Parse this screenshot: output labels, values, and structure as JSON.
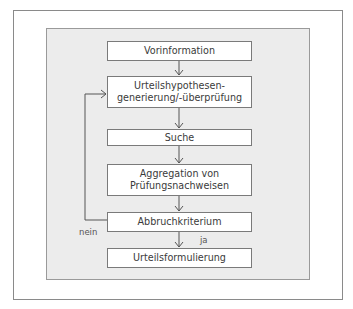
{
  "diagram": {
    "type": "flowchart",
    "nodes": [
      {
        "id": "vorinformation",
        "label": "Vorinformation"
      },
      {
        "id": "hypothesen",
        "label_line1": "Urteilshypothesen-",
        "label_line2": "generierung/-überprüfung"
      },
      {
        "id": "suche",
        "label": "Suche"
      },
      {
        "id": "aggregation",
        "label_line1": "Aggregation von",
        "label_line2": "Prüfungsnachweisen"
      },
      {
        "id": "abbruch",
        "label": "Abbruchkriterium"
      },
      {
        "id": "urteil",
        "label": "Urteilsformulierung"
      }
    ],
    "edges": [
      {
        "from": "vorinformation",
        "to": "hypothesen"
      },
      {
        "from": "hypothesen",
        "to": "suche"
      },
      {
        "from": "suche",
        "to": "aggregation"
      },
      {
        "from": "aggregation",
        "to": "abbruch"
      },
      {
        "from": "abbruch",
        "to": "urteil",
        "label": "ja"
      },
      {
        "from": "abbruch",
        "to": "hypothesen",
        "label": "nein"
      }
    ],
    "edge_labels": {
      "yes": "ja",
      "no": "nein"
    },
    "colors": {
      "panel": "#ececec",
      "node_fill": "#ffffff",
      "stroke": "#7a7a7a",
      "frame": "#8a8a8a"
    }
  }
}
